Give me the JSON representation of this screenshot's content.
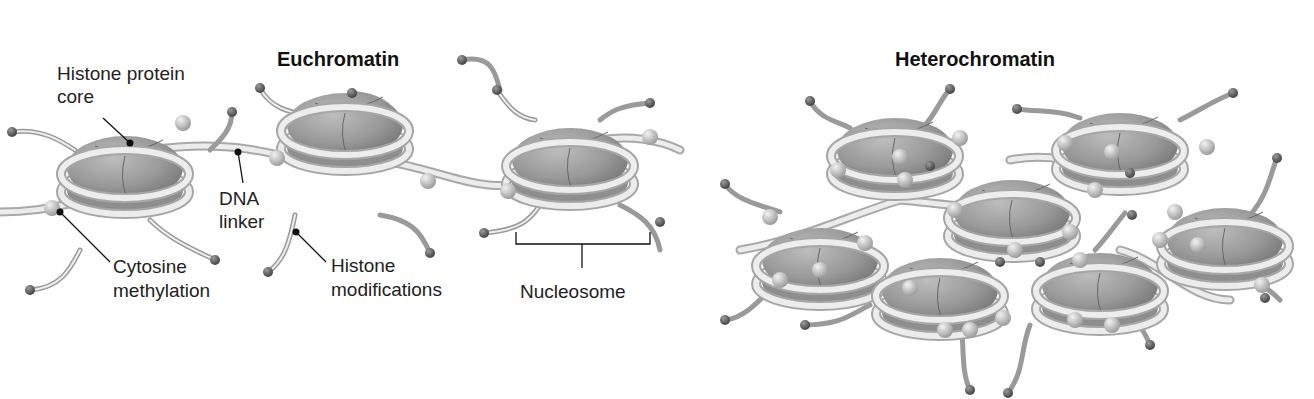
{
  "top_strip": {
    "text": ""
  },
  "panels": [
    {
      "title": "Euchromatin",
      "labels": {
        "histone_core_line1": "Histone protein",
        "histone_core_line2": "core",
        "dna_linker_line1": "DNA",
        "dna_linker_line2": "linker",
        "cytosine_line1": "Cytosine",
        "cytosine_line2": "methylation",
        "histone_mod_line1": "Histone",
        "histone_mod_line2": "modifications",
        "nucleosome": "Nucleosome"
      }
    },
    {
      "title": "Heterochromatin"
    }
  ],
  "colors": {
    "histone_core": "#8c8c8c",
    "histone_core_light": "#b9b9b9",
    "dna": "#e6e6e6",
    "dna_edge": "#a8a8a8",
    "tail_ball": "#6a6a6a",
    "methyl_ball": "#c8c8c8",
    "leader_line": "#111111"
  }
}
